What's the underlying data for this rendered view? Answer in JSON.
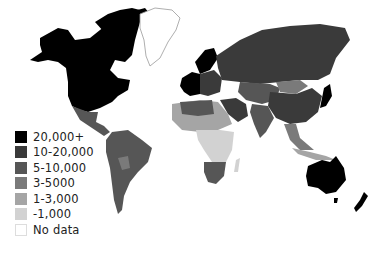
{
  "map": {
    "type": "choropleth world map",
    "colors": {
      "c20000": "#000000",
      "c10000": "#3a3a3a",
      "c5000": "#565656",
      "c3000": "#7a7a7a",
      "c1000": "#a5a5a5",
      "cless": "#d2d2d2",
      "nodata": "#ffffff",
      "outline": "#bbbbbb"
    }
  },
  "legend": {
    "items": [
      {
        "label": "20,000+",
        "color": "#000000"
      },
      {
        "label": "10-20,000",
        "color": "#3a3a3a"
      },
      {
        "label": "5-10,000",
        "color": "#565656"
      },
      {
        "label": "3-5000",
        "color": "#7a7a7a"
      },
      {
        "label": "1-3,000",
        "color": "#a5a5a5"
      },
      {
        "label": "-1,000",
        "color": "#d2d2d2"
      },
      {
        "label": "No data",
        "color": "#ffffff"
      }
    ]
  }
}
